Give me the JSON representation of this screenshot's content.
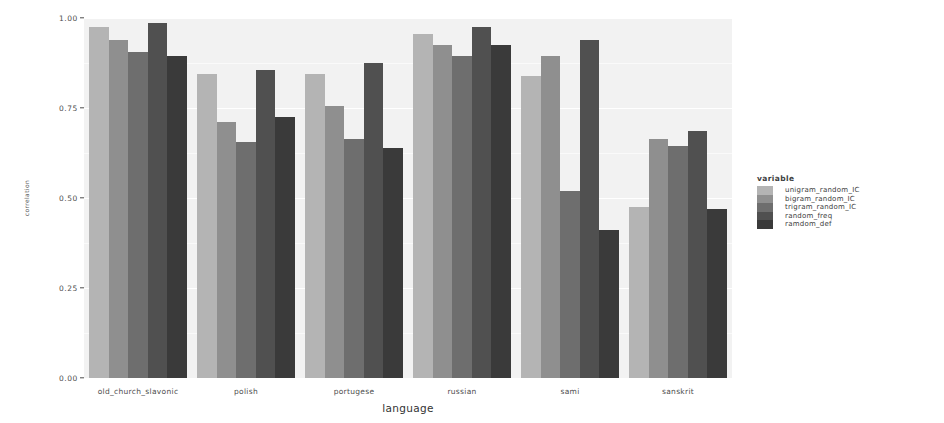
{
  "chart_data": {
    "type": "bar",
    "title": "",
    "subtitle": "",
    "xlabel": "language",
    "ylabel": "correlation",
    "ylim": [
      0.0,
      1.0
    ],
    "yticks": [
      "0.00",
      "0.25",
      "0.50",
      "0.75",
      "1.00"
    ],
    "ytick_values": [
      0.0,
      0.25,
      0.5,
      0.75,
      1.0
    ],
    "grid": true,
    "grid_color": "#ffffff",
    "panel_background": "#f2f2f2",
    "legend_position": "right",
    "legend_title": "variable",
    "bar_mode": "grouped",
    "categories": [
      "old_church_slavonic",
      "polish",
      "portugese",
      "russian",
      "sami",
      "sanskrit"
    ],
    "series": [
      {
        "name": "unigram_random_IC",
        "color": "#b4b4b4",
        "values": [
          0.975,
          0.845,
          0.845,
          0.955,
          0.84,
          0.475
        ]
      },
      {
        "name": "bigram_random_IC",
        "color": "#8f8f8f",
        "values": [
          0.94,
          0.71,
          0.755,
          0.925,
          0.895,
          0.665
        ]
      },
      {
        "name": "trigram_random_IC",
        "color": "#6e6e6e",
        "values": [
          0.905,
          0.655,
          0.665,
          0.895,
          0.52,
          0.645
        ]
      },
      {
        "name": "random_freq",
        "color": "#505050",
        "values": [
          0.985,
          0.855,
          0.875,
          0.975,
          0.94,
          0.685
        ]
      },
      {
        "name": "ramdom_def",
        "color": "#3a3a3a",
        "values": [
          0.895,
          0.725,
          0.64,
          0.925,
          0.41,
          0.47
        ]
      }
    ]
  }
}
